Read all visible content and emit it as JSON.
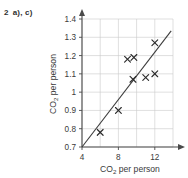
{
  "exercise": {
    "number": "2",
    "parts": "a), c)"
  },
  "chart_data": {
    "type": "scatter",
    "title": "",
    "xlabel": "CO2 per person",
    "ylabel": "CO2 per person",
    "xlabel_base": "CO",
    "xlabel_sub": "2",
    "xlabel_rest": " per person",
    "ylabel_base": "CO",
    "ylabel_sub": "2",
    "ylabel_rest": " per person",
    "xlim": [
      4,
      14
    ],
    "ylim": [
      0.7,
      1.45
    ],
    "xticks": [
      4,
      8,
      12
    ],
    "xticklabels": [
      "4",
      "8",
      "12"
    ],
    "yticks": [
      0.7,
      0.8,
      0.9,
      1.0,
      1.1,
      1.2,
      1.3,
      1.4
    ],
    "yticklabels": [
      "0.7",
      "0.8",
      "0.9",
      "1",
      "1.1",
      "1.2",
      "1.3",
      "1.4"
    ],
    "grid": true,
    "grid_x": [
      4,
      6,
      8,
      10,
      12,
      14
    ],
    "grid_y": [
      0.7,
      0.8,
      0.9,
      1.0,
      1.1,
      1.2,
      1.3,
      1.4
    ],
    "marker": "x",
    "points": [
      {
        "x": 6.0,
        "y": 0.78
      },
      {
        "x": 8.0,
        "y": 0.9
      },
      {
        "x": 9.0,
        "y": 1.18
      },
      {
        "x": 9.7,
        "y": 1.19
      },
      {
        "x": 9.6,
        "y": 1.07
      },
      {
        "x": 11.0,
        "y": 1.08
      },
      {
        "x": 12.0,
        "y": 1.1
      },
      {
        "x": 12.0,
        "y": 1.27
      }
    ],
    "trendline": {
      "type": "line-of-best-fit",
      "x_start": 4.0,
      "y_start": 0.7,
      "x_end": 13.8,
      "y_end": 1.335
    },
    "colors": {
      "axis": "#4a4a4a",
      "grid": "#c9c9c9",
      "marker": "#2b2b2b",
      "trendline": "#3c3c3c",
      "text": "#3a3a3a",
      "background": "#ffffff"
    }
  }
}
